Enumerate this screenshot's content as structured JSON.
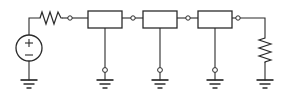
{
  "diagram": {
    "type": "electrical-circuit-schematic",
    "background_color": "#ffffff",
    "line_color": "#2b2b2b",
    "canvas": {
      "width": 283,
      "height": 99
    }
  },
  "components": {
    "voltage_source": {
      "name": "voltage-source",
      "symbol": "circle-with-plus-minus",
      "plus_label": "+",
      "minus_label": "−",
      "center": {
        "x": 29,
        "y": 48
      },
      "radius": 13
    },
    "series_resistor": {
      "name": "series-resistor",
      "symbol": "zigzag-horizontal",
      "orientation": "horizontal",
      "peaks": 3,
      "start": {
        "x": 40,
        "y": 18
      },
      "end": {
        "x": 63,
        "y": 18
      }
    },
    "load_resistor": {
      "name": "load-resistor",
      "symbol": "zigzag-vertical",
      "orientation": "vertical",
      "peaks": 4,
      "start": {
        "x": 265,
        "y": 38
      },
      "end": {
        "x": 265,
        "y": 63
      }
    },
    "boxes": [
      {
        "name": "two-port-box-1",
        "x": 88,
        "y": 11,
        "width": 34,
        "height": 17,
        "tap_x": 105
      },
      {
        "name": "two-port-box-2",
        "x": 143,
        "y": 11,
        "width": 34,
        "height": 17,
        "tap_x": 160
      },
      {
        "name": "two-port-box-3",
        "x": 198,
        "y": 11,
        "width": 34,
        "height": 17,
        "tap_x": 215
      }
    ],
    "terminal_nodes": [
      {
        "name": "node-source-to-box1",
        "x": 70,
        "y": 18
      },
      {
        "name": "node-box1-to-box2",
        "x": 133,
        "y": 18
      },
      {
        "name": "node-box2-to-box3",
        "x": 188,
        "y": 18
      },
      {
        "name": "node-box3-to-load",
        "x": 238,
        "y": 18
      }
    ],
    "shunt_nodes": [
      {
        "name": "shunt-node-1",
        "x": 105,
        "y": 70
      },
      {
        "name": "shunt-node-2",
        "x": 160,
        "y": 70
      },
      {
        "name": "shunt-node-3",
        "x": 215,
        "y": 70
      }
    ],
    "grounds": [
      {
        "name": "ground-source",
        "x": 29,
        "y": 80
      },
      {
        "name": "ground-shunt-1",
        "x": 105,
        "y": 80
      },
      {
        "name": "ground-shunt-2",
        "x": 160,
        "y": 80
      },
      {
        "name": "ground-shunt-3",
        "x": 215,
        "y": 80
      },
      {
        "name": "ground-load",
        "x": 265,
        "y": 80
      }
    ],
    "ground_symbol": {
      "bar_widths": [
        17,
        11,
        5
      ],
      "bar_gap": 3.5,
      "bar_thickness": [
        1.6,
        1.4,
        1.4
      ]
    },
    "wires": [
      {
        "name": "wire-source-top",
        "path": "M29,35 L29,18 L40,18"
      },
      {
        "name": "wire-resistor-to-node1",
        "path": "M63,18 L68,18"
      },
      {
        "name": "wire-node1-to-box1",
        "path": "M72,18 L88,18"
      },
      {
        "name": "wire-box1-to-node2",
        "path": "M122,18 L131,18"
      },
      {
        "name": "wire-node2-to-box2",
        "path": "M135,18 L143,18"
      },
      {
        "name": "wire-box2-to-node3",
        "path": "M177,18 L186,18"
      },
      {
        "name": "wire-node3-to-box3",
        "path": "M190,18 L198,18"
      },
      {
        "name": "wire-box3-to-node4",
        "path": "M232,18 L236,18"
      },
      {
        "name": "wire-node4-to-load",
        "path": "M240,18 L265,18 L265,38"
      },
      {
        "name": "wire-source-to-ground",
        "path": "M29,61 L29,80"
      },
      {
        "name": "wire-shunt-1",
        "path": "M105,28 L105,68"
      },
      {
        "name": "wire-shunt-1-ground",
        "path": "M105,72 L105,80"
      },
      {
        "name": "wire-shunt-2",
        "path": "M160,28 L160,68"
      },
      {
        "name": "wire-shunt-2-ground",
        "path": "M160,72 L160,80"
      },
      {
        "name": "wire-shunt-3",
        "path": "M215,28 L215,68"
      },
      {
        "name": "wire-shunt-3-ground",
        "path": "M215,72 L215,80"
      },
      {
        "name": "wire-load-to-ground",
        "path": "M265,63 L265,80"
      }
    ]
  }
}
